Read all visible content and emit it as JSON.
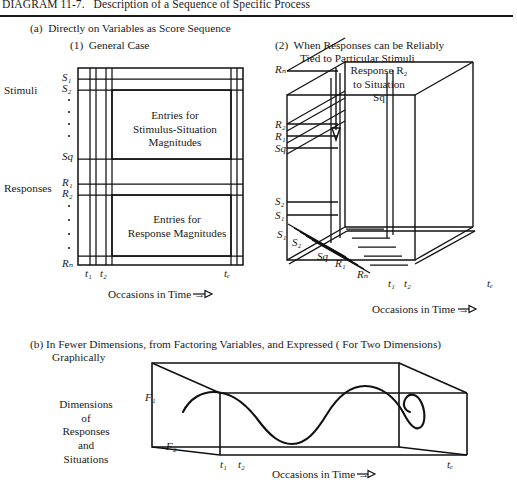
{
  "header": {
    "title": "DIAGRAM 11-7.   Description of a Sequence of Specific Process"
  },
  "sections": {
    "a_label": "(a)  Directly on Variables as Score Sequence",
    "a1_label": "(1)  General Case",
    "a2_label_line1": "(2)  When Responses can be Reliably",
    "a2_label_line2": "Tied to Particular Stimuli",
    "b_label": "(b) In Fewer Dimensions, from Factoring Variables, and Expressed ( For Two Dimensions)",
    "b_label_line2": "Graphically"
  },
  "panel1": {
    "side_label_stimuli": "Stimuli",
    "side_label_responses": "Responses",
    "row_labels_stimuli": [
      "S₁",
      "S₂",
      "Sq"
    ],
    "row_labels_responses": [
      "R₁",
      "R₂",
      "Rₙ"
    ],
    "cell_text_top": "Entries  for\nStimulus-Situation\nMagnitudes",
    "cell_text_bottom": "Entries  for\nResponse Magnitudes",
    "time_ticks": [
      "t₁",
      "t₂",
      "tₑ"
    ],
    "axis_caption": "Occasions in Time →"
  },
  "panel2": {
    "vertical_labels": [
      "Rₙ",
      "R₂",
      "R₁",
      "Sq",
      "S₂",
      "S₁"
    ],
    "floor_labels": [
      "S₁",
      "S₂",
      "Sq",
      "R₁",
      "Rₙ"
    ],
    "annotation": "Response R₂\nto Situation\nSq",
    "time_ticks": [
      "t₁",
      "t₂",
      "tₑ"
    ],
    "axis_caption": "Occasions in Time →"
  },
  "panel3": {
    "axis_label_f1": "F₁",
    "axis_label_f2": "F₂",
    "side_label": "Dimensions\nof\nResponses\nand\nSituations",
    "time_ticks": [
      "t₁",
      "t₂",
      "tₑ"
    ],
    "axis_caption": "Occasions in Time →"
  },
  "colors": {
    "ink": "#111111",
    "paper": "#ffffff"
  }
}
